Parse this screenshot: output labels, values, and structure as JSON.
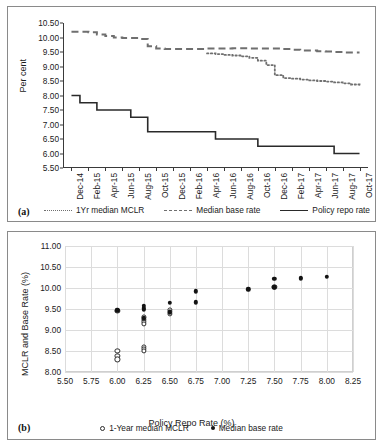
{
  "figure": {
    "panel_a_tag": "(a)",
    "panel_b_tag": "(b)"
  },
  "panel_a": {
    "ylabel": "Per cent",
    "legend": [
      {
        "label": "1Yr median MCLR",
        "style": "dotted",
        "color": "#6f6f6f"
      },
      {
        "label": "Median base rate",
        "style": "dashed",
        "color": "#6f6f6f"
      },
      {
        "label": "Policy repo rate",
        "style": "solid",
        "color": "#2a2a2a"
      }
    ]
  },
  "panel_b": {
    "xlabel": "Policy Repo Rate (%)",
    "ylabel": "MCLR and Base Rate (%)",
    "legend": [
      {
        "label": "1-Year median MCLR",
        "marker": "open-circle"
      },
      {
        "label": "Median base rate",
        "marker": "filled-circle"
      }
    ]
  },
  "chart_data": [
    {
      "id": "panel-a",
      "type": "line",
      "title": "",
      "xlabel": "",
      "ylabel": "Per cent",
      "ylim": [
        5.5,
        10.5
      ],
      "yticks": [
        5.5,
        6.0,
        6.5,
        7.0,
        7.5,
        8.0,
        8.5,
        9.0,
        9.5,
        10.0,
        10.5
      ],
      "ytick_labels": [
        "5.50",
        "6.00",
        "6.50",
        "7.00",
        "7.50",
        "8.00",
        "8.50",
        "9.00",
        "9.50",
        "10.00",
        "10.50"
      ],
      "grid": false,
      "legend_position": "bottom",
      "categories": [
        "Dec-14",
        "Feb-15",
        "Apr-15",
        "Jun-15",
        "Aug-15",
        "Oct-15",
        "Dec-15",
        "Feb-16",
        "Apr-16",
        "Jun-16",
        "Aug-16",
        "Oct-16",
        "Dec-16",
        "Feb-17",
        "Apr-17",
        "Jun-17",
        "Aug-17",
        "Oct-17"
      ],
      "x_monthly": [
        "Dec-14",
        "Jan-15",
        "Feb-15",
        "Mar-15",
        "Apr-15",
        "May-15",
        "Jun-15",
        "Jul-15",
        "Aug-15",
        "Sep-15",
        "Oct-15",
        "Nov-15",
        "Dec-15",
        "Jan-16",
        "Feb-16",
        "Mar-16",
        "Apr-16",
        "May-16",
        "Jun-16",
        "Jul-16",
        "Aug-16",
        "Sep-16",
        "Oct-16",
        "Nov-16",
        "Dec-16",
        "Jan-17",
        "Feb-17",
        "Mar-17",
        "Apr-17",
        "May-17",
        "Jun-17",
        "Jul-17",
        "Aug-17",
        "Sep-17",
        "Oct-17"
      ],
      "series": [
        {
          "name": "Policy repo rate",
          "style": "solid",
          "color": "#2a2a2a",
          "values": [
            8.0,
            7.75,
            7.75,
            7.5,
            7.5,
            7.5,
            7.5,
            7.25,
            7.25,
            6.75,
            6.75,
            6.75,
            6.75,
            6.75,
            6.75,
            6.75,
            6.75,
            6.5,
            6.5,
            6.5,
            6.5,
            6.5,
            6.25,
            6.25,
            6.25,
            6.25,
            6.25,
            6.25,
            6.25,
            6.25,
            6.25,
            6.0,
            6.0,
            6.0,
            6.0
          ]
        },
        {
          "name": "Median base rate",
          "style": "dashed",
          "color": "#6f6f6f",
          "values": [
            10.2,
            10.2,
            10.18,
            10.1,
            10.05,
            10.0,
            9.98,
            9.98,
            9.95,
            9.7,
            9.62,
            9.6,
            9.6,
            9.6,
            9.6,
            9.6,
            9.62,
            9.62,
            9.62,
            9.63,
            9.63,
            9.62,
            9.62,
            9.62,
            9.62,
            9.6,
            9.58,
            9.55,
            9.55,
            9.53,
            9.52,
            9.5,
            9.48,
            9.48,
            9.48
          ]
        },
        {
          "name": "1Yr median MCLR",
          "style": "dotted",
          "color": "#6f6f6f",
          "values": [
            null,
            null,
            null,
            null,
            null,
            null,
            null,
            null,
            null,
            null,
            null,
            null,
            null,
            null,
            null,
            null,
            9.45,
            9.43,
            9.4,
            9.38,
            9.35,
            9.3,
            9.2,
            9.05,
            8.7,
            8.6,
            8.58,
            8.55,
            8.52,
            8.5,
            8.48,
            8.45,
            8.42,
            8.38,
            8.3
          ]
        }
      ]
    },
    {
      "id": "panel-b",
      "type": "scatter",
      "title": "",
      "xlabel": "Policy Repo Rate (%)",
      "ylabel": "MCLR and Base Rate (%)",
      "xlim": [
        5.5,
        8.25
      ],
      "ylim": [
        8.0,
        11.0
      ],
      "xticks": [
        5.5,
        5.75,
        6.0,
        6.25,
        6.5,
        6.75,
        7.0,
        7.25,
        7.5,
        7.75,
        8.0,
        8.25
      ],
      "xtick_labels": [
        "5.50",
        "5.75",
        "6.00",
        "6.25",
        "6.50",
        "6.75",
        "7.00",
        "7.25",
        "7.50",
        "7.75",
        "8.00",
        "8.25"
      ],
      "yticks": [
        8.0,
        8.5,
        9.0,
        9.5,
        10.0,
        10.5,
        11.0
      ],
      "ytick_labels": [
        "8.00",
        "8.50",
        "9.00",
        "9.50",
        "10.00",
        "10.50",
        "11.00"
      ],
      "grid": true,
      "legend_position": "bottom",
      "series": [
        {
          "name": "1-Year median MCLR",
          "marker": "open-circle",
          "points": [
            [
              6.0,
              8.5
            ],
            [
              6.0,
              8.38
            ],
            [
              6.0,
              8.3
            ],
            [
              6.25,
              8.6
            ],
            [
              6.25,
              8.55
            ],
            [
              6.25,
              8.5
            ],
            [
              6.25,
              9.3
            ],
            [
              6.25,
              9.25
            ],
            [
              6.25,
              9.2
            ],
            [
              6.25,
              9.15
            ],
            [
              6.5,
              9.48
            ],
            [
              6.5,
              9.43
            ],
            [
              6.5,
              9.38
            ],
            [
              6.0,
              9.46
            ],
            [
              7.5,
              10.02
            ]
          ]
        },
        {
          "name": "Median base rate",
          "marker": "filled-circle",
          "points": [
            [
              6.0,
              9.48
            ],
            [
              6.0,
              9.45
            ],
            [
              6.25,
              9.58
            ],
            [
              6.25,
              9.52
            ],
            [
              6.25,
              9.48
            ],
            [
              6.25,
              9.28
            ],
            [
              6.5,
              9.65
            ],
            [
              6.5,
              9.42
            ],
            [
              6.75,
              9.92
            ],
            [
              6.75,
              9.66
            ],
            [
              7.25,
              9.97
            ],
            [
              7.5,
              10.22
            ],
            [
              7.5,
              10.02
            ],
            [
              7.75,
              10.25
            ],
            [
              7.75,
              10.22
            ],
            [
              8.0,
              10.27
            ]
          ]
        }
      ]
    }
  ]
}
